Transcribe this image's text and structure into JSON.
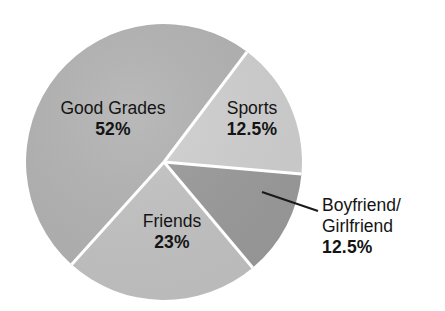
{
  "page": {
    "background_color": "#ffffff",
    "top_cut_text_remnant": " "
  },
  "chart_data": {
    "type": "pie",
    "title": "",
    "subtitle": "",
    "xlabel": "",
    "ylabel": "",
    "legend_position": "none",
    "grid": false,
    "labels_inside_slices": true,
    "categories": [
      "Good Grades",
      "Sports",
      "Boyfriend/Girlfriend",
      "Friends"
    ],
    "values": [
      52,
      12.5,
      12.5,
      23
    ],
    "value_unit": "%",
    "slices": [
      {
        "name": "Good Grades",
        "value": 52,
        "value_text": "52%",
        "color": "#b2b2b2",
        "label_placement": "inside",
        "start_angle_deg": 222,
        "end_angle_deg": 397
      },
      {
        "name": "Sports",
        "value": 12.5,
        "value_text": "12.5%",
        "color": "#d0d0d0",
        "label_placement": "inside",
        "start_angle_deg": 37,
        "end_angle_deg": 95
      },
      {
        "name": "Boyfriend/Girlfriend",
        "name_line_1": "Boyfriend/",
        "name_line_2": "Girlfriend",
        "value": 12.5,
        "value_text": "12.5%",
        "color": "#9b9b9b",
        "label_placement": "outside-with-leader-line",
        "start_angle_deg": 95,
        "end_angle_deg": 140
      },
      {
        "name": "Friends",
        "value": 23,
        "value_text": "23%",
        "color": "#c3c3c3",
        "label_placement": "inside",
        "start_angle_deg": 140,
        "end_angle_deg": 222
      }
    ],
    "leader_line": {
      "from_x": 262,
      "from_y": 192,
      "to_x": 318,
      "to_y": 211,
      "color": "#1a1a1a"
    },
    "geometry": {
      "center_x": 164,
      "center_y": 162,
      "radius": 138,
      "separator_color": "#ffffff",
      "separator_width": 3
    }
  }
}
